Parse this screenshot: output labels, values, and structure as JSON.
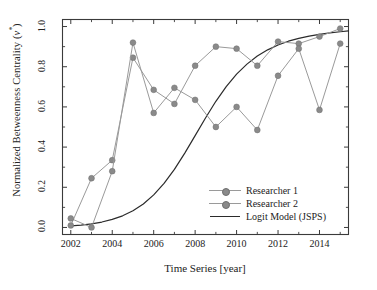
{
  "chart_data": {
    "type": "line",
    "title": "",
    "xlabel": "Time Series [year]",
    "ylabel": "Normalized Betweenness Centrality (v*)",
    "ylabel_prefix": "Normalized Betweenness Centrality (",
    "ylabel_var": "v",
    "ylabel_sup": "*",
    "ylabel_suffix": ")",
    "x": [
      2002,
      2003,
      2004,
      2005,
      2006,
      2007,
      2008,
      2009,
      2010,
      2011,
      2012,
      2013,
      2014,
      2015
    ],
    "xlim": [
      2001.6,
      2015.4
    ],
    "ylim": [
      -0.035,
      1.035
    ],
    "xticks": [
      2002,
      2004,
      2006,
      2008,
      2010,
      2012,
      2014
    ],
    "xticklabels": [
      "2002",
      "2004",
      "2006",
      "2008",
      "2010",
      "2012",
      "2014"
    ],
    "yticks": [
      0.0,
      0.2,
      0.4,
      0.6,
      0.8,
      1.0
    ],
    "yticklabels": [
      "0.0",
      "0.2",
      "0.4",
      "0.6",
      "0.8",
      "1.0"
    ],
    "grid": false,
    "legend_position": "lower right",
    "series": [
      {
        "name": "Researcher 1",
        "style": "line-marker",
        "color": "#9a9a9a",
        "marker_color": "#8a8a8a",
        "values": [
          0.01,
          0.245,
          0.335,
          0.845,
          0.685,
          0.615,
          0.805,
          0.9,
          0.89,
          0.805,
          0.925,
          0.915,
          0.95,
          0.99
        ]
      },
      {
        "name": "Researcher 2",
        "style": "line-marker",
        "color": "#9a9a9a",
        "marker_color": "#8a8a8a",
        "values": [
          0.045,
          0.0,
          0.28,
          0.92,
          0.57,
          0.695,
          0.635,
          0.5,
          0.6,
          0.485,
          0.755,
          0.89,
          0.585,
          0.915
        ]
      },
      {
        "name": "Logit Model (JSPS)",
        "style": "line",
        "color": "#2b2b2b",
        "x": [
          2002.0,
          2002.5,
          2003.0,
          2003.5,
          2004.0,
          2004.5,
          2005.0,
          2005.5,
          2006.0,
          2006.5,
          2007.0,
          2007.5,
          2008.0,
          2008.5,
          2009.0,
          2009.5,
          2010.0,
          2010.5,
          2011.0,
          2011.5,
          2012.0,
          2012.5,
          2013.0,
          2013.5,
          2014.0,
          2014.5,
          2015.0,
          2015.4
        ],
        "values": [
          0.008,
          0.012,
          0.018,
          0.027,
          0.04,
          0.058,
          0.083,
          0.117,
          0.162,
          0.219,
          0.289,
          0.37,
          0.457,
          0.545,
          0.628,
          0.701,
          0.763,
          0.813,
          0.853,
          0.884,
          0.908,
          0.927,
          0.941,
          0.952,
          0.961,
          0.968,
          0.974,
          0.978
        ]
      }
    ]
  },
  "legend": {
    "items": [
      {
        "label": "Researcher 1",
        "key": "line-marker"
      },
      {
        "label": "Researcher 2",
        "key": "line-marker"
      },
      {
        "label": "Logit Model (JSPS)",
        "key": "line"
      }
    ]
  }
}
